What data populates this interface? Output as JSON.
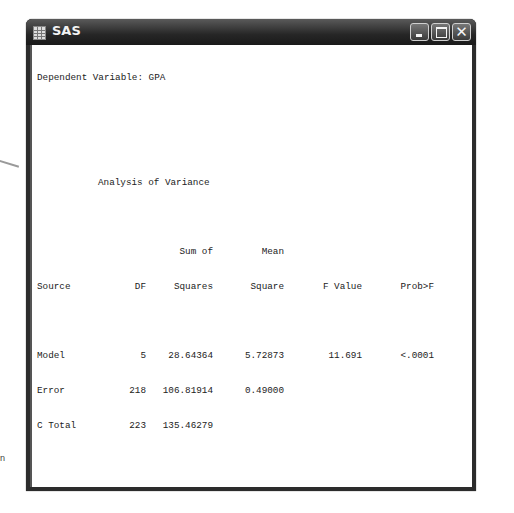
{
  "window": {
    "title": "SAS",
    "icon": "sas-app-icon",
    "controls": [
      "minimize",
      "maximize",
      "close"
    ]
  },
  "background": {
    "side_label": "n"
  },
  "output": {
    "dependent_variable": "Dependent Variable: GPA",
    "anova": {
      "title": "Analysis of Variance",
      "header_line1": [
        "",
        "",
        "Sum of",
        "Mean",
        "",
        ""
      ],
      "header_line2": [
        "Source",
        "DF",
        "Squares",
        "Square",
        "F Value",
        "Prob>F"
      ],
      "rows": [
        {
          "source": "Model",
          "df": "5",
          "ss": "28.64364",
          "ms": "5.72873",
          "f": "11.691",
          "p": "<.0001"
        },
        {
          "source": "Error",
          "df": "218",
          "ss": "106.81914",
          "ms": "0.49000",
          "f": "",
          "p": ""
        },
        {
          "source": "C Total",
          "df": "223",
          "ss": "135.46279",
          "ms": "",
          "f": "",
          "p": ""
        }
      ]
    },
    "fit": [
      {
        "label": "Root MSE",
        "value": "0.70000",
        "label2": "R-Square",
        "value2": "0.2115"
      },
      {
        "label": "Dep Mean",
        "value": "2.63522",
        "label2": "Adj R-sq",
        "value2": "0.1934"
      },
      {
        "label": "C.V.",
        "value": "26.56311",
        "label2": "",
        "value2": ""
      }
    ],
    "params": {
      "title": "Parameter Estimates",
      "header_line1": [
        "",
        "",
        "Parameter",
        "Standard",
        "T for H0:",
        ""
      ],
      "header_line2": [
        "Variable",
        "DF",
        "Estimate",
        "Error",
        "Parameter=0",
        "Prob > |T|"
      ],
      "rows": [
        {
          "var": "INTERCEP",
          "df": "1",
          "est": "0.326719",
          "se": "0.39999643",
          "t": "0.817",
          "p": "0.4149"
        },
        {
          "var": "SATM",
          "df": "1",
          "est": "0.000944",
          "se": "0.00068566",
          "t": "1.376",
          "p": "0.1702"
        },
        {
          "var": "SATV",
          "df": "1",
          "est": "-0.000408",
          "se": "0.00059189",
          "t": "-0.689",
          "p": "0.4915"
        },
        {
          "var": "HSM",
          "df": "1",
          "est": "0.145961",
          "se": "0.03926097",
          "t": "3.718",
          "p": "0.0003"
        },
        {
          "var": "HSS",
          "df": "1",
          "est": "0.035905",
          "se": "0.03779841",
          "t": "0.950",
          "p": "0.3432"
        },
        {
          "var": "HSE",
          "df": "1",
          "est": "0.055293",
          "se": "0.03956869",
          "t": "1.397",
          "p": "0.1637"
        }
      ]
    },
    "tests": [
      {
        "name": "Test: SAT",
        "num_label": "Numerator:",
        "num_value": "0.4657",
        "num_df_label": "DF:",
        "num_df": "2",
        "stat_label": "F value:",
        "stat_value": "0.9503",
        "den_label": "Denominator:",
        "den_value": "0.489996",
        "den_df_label": "DF:",
        "den_df": "218",
        "prob_label": "Prob>F:",
        "prob_value": "0.3882"
      },
      {
        "name": "Test: HS",
        "num_label": "Numerator:",
        "num_value": "6.6866",
        "num_df_label": "DF:",
        "num_df": "3",
        "stat_label": "F value:",
        "stat_value": "13.6462",
        "den_label": "Denominator:",
        "den_value": "0.489996",
        "den_df_label": "DF:",
        "den_df": "218",
        "prob_label": "Prob>F:",
        "prob_value": "0.0001"
      }
    ]
  }
}
